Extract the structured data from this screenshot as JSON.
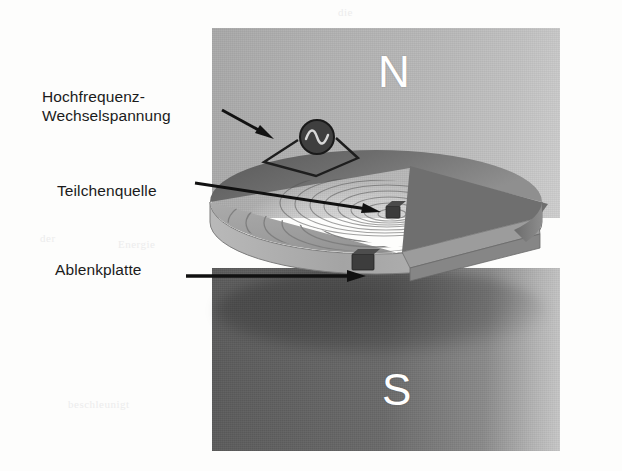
{
  "figure": {
    "type": "cyclotron-cross-section-diagram",
    "language": "de",
    "background_color": "#fdfdfc"
  },
  "magnet": {
    "north": {
      "letter": "N",
      "letter_color": "#ffffff",
      "fill_color": "#b5b5b5"
    },
    "south": {
      "letter": "S",
      "letter_color": "#ffffff",
      "fill_color": "#666666"
    }
  },
  "labels": [
    {
      "id": "hochfrequenz",
      "text": "Hochfrequenz-\nWechselspannung",
      "points_to": "oscillator"
    },
    {
      "id": "teilchenquelle",
      "text": "Teilchenquelle",
      "points_to": "particle-source"
    },
    {
      "id": "ablenkplatte",
      "text": "Ablenkplatte",
      "points_to": "deflector-plate"
    }
  ],
  "parts": {
    "oscillator_symbol": "ac-source-sine",
    "particle_source_color": "#3a3a3a",
    "deflector_plate_color": "#3a3a3a",
    "dee_top_color": "#9a9a9a",
    "dee_spiral_color": "#7b7b7b",
    "disk_edge_color": "#8c8c8c"
  },
  "scan_artifacts": [
    {
      "text": "die",
      "x": 338,
      "y": 6
    },
    {
      "text": "Zyklotron",
      "x": 470,
      "y": 30
    },
    {
      "text": "lichen",
      "x": 486,
      "y": 56
    },
    {
      "text": "Teilchen",
      "x": 382,
      "y": 52
    },
    {
      "text": "der",
      "x": 40,
      "y": 232
    },
    {
      "text": "Energie",
      "x": 118,
      "y": 238
    },
    {
      "text": "beschleunigt",
      "x": 68,
      "y": 398
    },
    {
      "text": "Spannung",
      "x": 470,
      "y": 408
    }
  ]
}
